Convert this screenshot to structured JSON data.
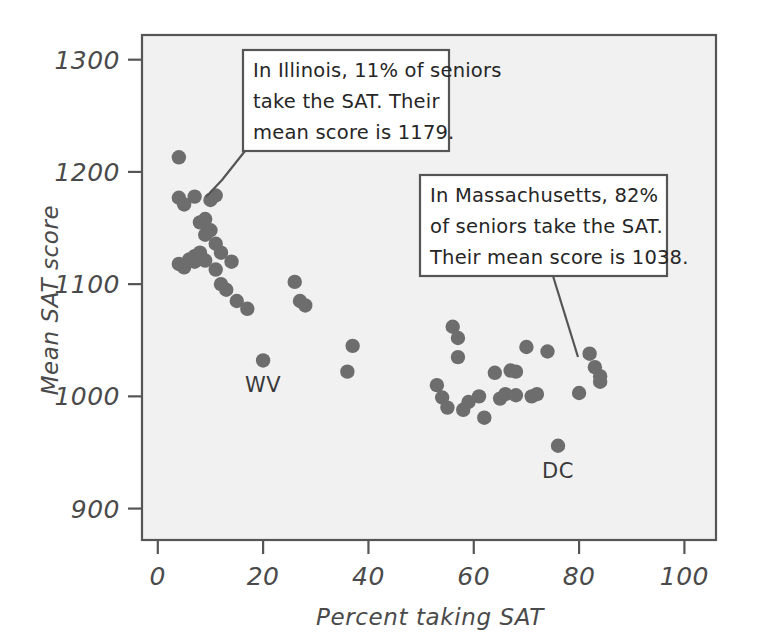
{
  "figure": {
    "background_color": "#ffffff",
    "plot_background_color": "#f1f1f1",
    "frame_color": "#555555",
    "dot_color": "#6d6d6d",
    "text_color": "#4a4a4a"
  },
  "chart_data": {
    "type": "scatter",
    "title": "",
    "xlabel": "Percent taking SAT",
    "ylabel": "Mean SAT score",
    "xlim": [
      -3,
      106
    ],
    "ylim": [
      872,
      1322
    ],
    "xticks": [
      0,
      20,
      40,
      60,
      80,
      100
    ],
    "xtick_labels": [
      "0",
      "20",
      "40",
      "60",
      "80",
      "100"
    ],
    "yticks": [
      900,
      1000,
      1100,
      1200,
      1300
    ],
    "ytick_labels": [
      "900",
      "1000",
      "1100",
      "1200",
      "1300"
    ],
    "grid": false,
    "legend": "none",
    "series": [
      {
        "name": "States",
        "points": [
          {
            "x": 4,
            "y": 1213
          },
          {
            "x": 4,
            "y": 1177
          },
          {
            "x": 5,
            "y": 1171
          },
          {
            "x": 4,
            "y": 1118
          },
          {
            "x": 5,
            "y": 1115
          },
          {
            "x": 6,
            "y": 1122
          },
          {
            "x": 7,
            "y": 1178
          },
          {
            "x": 7,
            "y": 1125
          },
          {
            "x": 7,
            "y": 1120
          },
          {
            "x": 8,
            "y": 1155
          },
          {
            "x": 8,
            "y": 1128
          },
          {
            "x": 8,
            "y": 1124
          },
          {
            "x": 9,
            "y": 1158
          },
          {
            "x": 9,
            "y": 1144
          },
          {
            "x": 9,
            "y": 1121
          },
          {
            "x": 10,
            "y": 1175
          },
          {
            "x": 10,
            "y": 1148
          },
          {
            "x": 11,
            "y": 1179
          },
          {
            "x": 11,
            "y": 1136
          },
          {
            "x": 11,
            "y": 1113
          },
          {
            "x": 12,
            "y": 1100
          },
          {
            "x": 12,
            "y": 1128
          },
          {
            "x": 13,
            "y": 1095
          },
          {
            "x": 14,
            "y": 1120
          },
          {
            "x": 15,
            "y": 1085
          },
          {
            "x": 17,
            "y": 1078
          },
          {
            "x": 20,
            "y": 1032
          },
          {
            "x": 26,
            "y": 1102
          },
          {
            "x": 27,
            "y": 1085
          },
          {
            "x": 28,
            "y": 1081
          },
          {
            "x": 36,
            "y": 1022
          },
          {
            "x": 37,
            "y": 1045
          },
          {
            "x": 53,
            "y": 1010
          },
          {
            "x": 54,
            "y": 999
          },
          {
            "x": 55,
            "y": 990
          },
          {
            "x": 56,
            "y": 1062
          },
          {
            "x": 57,
            "y": 1052
          },
          {
            "x": 57,
            "y": 1035
          },
          {
            "x": 58,
            "y": 988
          },
          {
            "x": 59,
            "y": 995
          },
          {
            "x": 61,
            "y": 1000
          },
          {
            "x": 62,
            "y": 981
          },
          {
            "x": 64,
            "y": 1021
          },
          {
            "x": 65,
            "y": 998
          },
          {
            "x": 66,
            "y": 1002
          },
          {
            "x": 67,
            "y": 1023
          },
          {
            "x": 68,
            "y": 1022
          },
          {
            "x": 68,
            "y": 1001
          },
          {
            "x": 70,
            "y": 1044
          },
          {
            "x": 71,
            "y": 1000
          },
          {
            "x": 72,
            "y": 1002
          },
          {
            "x": 74,
            "y": 1040
          },
          {
            "x": 76,
            "y": 956
          },
          {
            "x": 80,
            "y": 1003
          },
          {
            "x": 82,
            "y": 1038
          },
          {
            "x": 83,
            "y": 1026
          },
          {
            "x": 84,
            "y": 1018
          },
          {
            "x": 84,
            "y": 1013
          }
        ]
      }
    ],
    "point_labels": [
      {
        "text": "WV",
        "x": 20,
        "y": 1032
      },
      {
        "text": "DC",
        "x": 76,
        "y": 956
      }
    ],
    "annotations": [
      {
        "id": "illinois",
        "lines": [
          "In Illinois, 11% of seniors",
          "take the SAT. Their",
          "mean score is 1179."
        ],
        "target": {
          "x": 11,
          "y": 1179
        }
      },
      {
        "id": "massachusetts",
        "lines": [
          "In Massachusetts, 82%",
          "of seniors take the SAT.",
          "Their mean score is 1038."
        ],
        "target": {
          "x": 82,
          "y": 1038
        }
      }
    ]
  }
}
